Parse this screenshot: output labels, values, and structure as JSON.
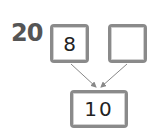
{
  "question": {
    "number": "20"
  },
  "number_bond": {
    "parts": [
      {
        "value": "8"
      },
      {
        "value": ""
      }
    ],
    "whole": {
      "value": "10"
    }
  },
  "colors": {
    "label": "#555555",
    "box_border": "#8a8a8a",
    "arrow": "#888888",
    "text": "#222222"
  }
}
